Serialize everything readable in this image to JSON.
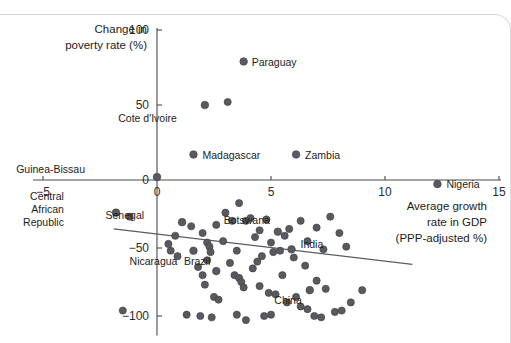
{
  "chart_data": {
    "type": "scatter",
    "title": "",
    "xlabel": "Average growth rate in GDP (PPP-adjusted %)",
    "ylabel": "Change in poverty rate (%)",
    "xlabel_lines": [
      "Average growth",
      "rate in GDP",
      "(PPP-adjusted %)"
    ],
    "ylabel_lines": [
      "Change in",
      "poverty rate (%)"
    ],
    "xlim": [
      -5,
      15
    ],
    "ylim": [
      -110,
      100
    ],
    "xticks": [
      -5,
      0,
      5,
      10,
      15
    ],
    "xtick_labels": [
      "−5",
      "0",
      "5",
      "10",
      "15"
    ],
    "yticks": [
      -100,
      -50,
      0,
      50,
      100
    ],
    "ytick_labels": [
      "−100",
      "−50",
      "0",
      "50",
      "100"
    ],
    "grid": false,
    "legend": "none",
    "marker_color": "#59595f",
    "trendline": {
      "x0": -1.9,
      "y0": -36,
      "x1": 11.2,
      "y1": -62,
      "color": "#5c5c62"
    },
    "labeled_points": [
      {
        "name": "Paraguay",
        "x": 3.8,
        "y": 79,
        "label_dx": 8,
        "label_dy": 4
      },
      {
        "name": "Cote d'Ivoire",
        "x": 2.1,
        "y": 50,
        "label_dx": -28,
        "label_dy": 17
      },
      {
        "name": "Madagascar",
        "x": 1.6,
        "y": 17,
        "label_dx": 9,
        "label_dy": 4
      },
      {
        "name": "Zambia",
        "x": 6.1,
        "y": 17,
        "label_dx": 9,
        "label_dy": 4
      },
      {
        "name": "Guinea-Bissau",
        "x": 0.0,
        "y": 2,
        "label_dx": -72,
        "label_dy": -4
      },
      {
        "name": "Nigeria",
        "x": 12.3,
        "y": -3,
        "label_dx": 9,
        "label_dy": 4
      },
      {
        "name": "Central African Republic",
        "x": -1.8,
        "y": -24,
        "label_dx": -52,
        "label_dy": 0
      },
      {
        "name": "Senegal",
        "x": 1.1,
        "y": -31,
        "label_dx": -38,
        "label_dy": -3
      },
      {
        "name": "Botswana",
        "x": 5.3,
        "y": -38,
        "label_dx": -8,
        "label_dy": -8
      },
      {
        "name": "Nicaragua",
        "x": 1.6,
        "y": -52,
        "label_dx": -16,
        "label_dy": 14
      },
      {
        "name": "Brazil",
        "x": 2.6,
        "y": -67,
        "label_dx": -6,
        "label_dy": -6
      },
      {
        "name": "India",
        "x": 5.9,
        "y": -51,
        "label_dx": 9,
        "label_dy": -1
      },
      {
        "name": "China",
        "x": 6.7,
        "y": -81,
        "label_dx": -8,
        "label_dy": 14
      }
    ],
    "unlabeled_points": [
      {
        "x": 3.1,
        "y": 52
      },
      {
        "x": -1.2,
        "y": -27
      },
      {
        "x": -1.5,
        "y": -96
      },
      {
        "x": 0.8,
        "y": -41
      },
      {
        "x": 1.5,
        "y": -34
      },
      {
        "x": 0.5,
        "y": -47
      },
      {
        "x": 0.6,
        "y": -52
      },
      {
        "x": 2.0,
        "y": -39
      },
      {
        "x": 2.2,
        "y": -46
      },
      {
        "x": 2.3,
        "y": -49
      },
      {
        "x": 2.35,
        "y": -53
      },
      {
        "x": 2.6,
        "y": -33
      },
      {
        "x": 2.9,
        "y": -45
      },
      {
        "x": 3.0,
        "y": -24
      },
      {
        "x": 3.3,
        "y": -30
      },
      {
        "x": 3.5,
        "y": -52
      },
      {
        "x": 3.6,
        "y": -17
      },
      {
        "x": 3.9,
        "y": -30
      },
      {
        "x": 4.1,
        "y": -28
      },
      {
        "x": 4.3,
        "y": -42
      },
      {
        "x": 4.5,
        "y": -37
      },
      {
        "x": 4.6,
        "y": -56
      },
      {
        "x": 4.8,
        "y": -29
      },
      {
        "x": 5.0,
        "y": -46
      },
      {
        "x": 5.1,
        "y": -53
      },
      {
        "x": 5.4,
        "y": -52
      },
      {
        "x": 5.6,
        "y": -41
      },
      {
        "x": 5.8,
        "y": -36
      },
      {
        "x": 6.0,
        "y": -57
      },
      {
        "x": 6.3,
        "y": -30
      },
      {
        "x": 6.6,
        "y": -45
      },
      {
        "x": 7.0,
        "y": -35
      },
      {
        "x": 7.3,
        "y": -51
      },
      {
        "x": 7.6,
        "y": -27
      },
      {
        "x": 8.0,
        "y": -39
      },
      {
        "x": 8.3,
        "y": -49
      },
      {
        "x": 1.8,
        "y": -64
      },
      {
        "x": 2.0,
        "y": -70
      },
      {
        "x": 2.1,
        "y": -77
      },
      {
        "x": 2.5,
        "y": -86
      },
      {
        "x": 2.7,
        "y": -88
      },
      {
        "x": 3.4,
        "y": -70
      },
      {
        "x": 3.6,
        "y": -72
      },
      {
        "x": 3.7,
        "y": -75
      },
      {
        "x": 3.8,
        "y": -79
      },
      {
        "x": 4.2,
        "y": -65
      },
      {
        "x": 4.5,
        "y": -78
      },
      {
        "x": 4.9,
        "y": -83
      },
      {
        "x": 5.2,
        "y": -84
      },
      {
        "x": 5.5,
        "y": -70
      },
      {
        "x": 5.7,
        "y": -90
      },
      {
        "x": 6.1,
        "y": -86
      },
      {
        "x": 6.3,
        "y": -93
      },
      {
        "x": 6.6,
        "y": -95
      },
      {
        "x": 7.0,
        "y": -74
      },
      {
        "x": 7.4,
        "y": -80
      },
      {
        "x": 7.8,
        "y": -97
      },
      {
        "x": 8.1,
        "y": -96
      },
      {
        "x": 8.5,
        "y": -90
      },
      {
        "x": 1.3,
        "y": -99
      },
      {
        "x": 1.9,
        "y": -100
      },
      {
        "x": 2.4,
        "y": -101
      },
      {
        "x": 3.5,
        "y": -99
      },
      {
        "x": 3.9,
        "y": -103
      },
      {
        "x": 4.7,
        "y": -100
      },
      {
        "x": 5.0,
        "y": -99
      },
      {
        "x": 6.9,
        "y": -100
      },
      {
        "x": 7.2,
        "y": -101
      },
      {
        "x": 9.0,
        "y": -81
      },
      {
        "x": 2.2,
        "y": -59
      },
      {
        "x": 4.4,
        "y": -60
      },
      {
        "x": 0.9,
        "y": -56
      },
      {
        "x": 3.2,
        "y": -61
      },
      {
        "x": 6.5,
        "y": -63
      }
    ]
  }
}
